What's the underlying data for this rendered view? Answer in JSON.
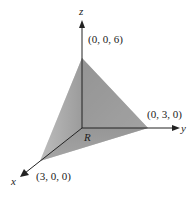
{
  "diagram": {
    "axes": {
      "x_label": "x",
      "y_label": "y",
      "z_label": "z"
    },
    "vertices": {
      "x_intercept": "(3, 0, 0)",
      "y_intercept": "(0, 3, 0)",
      "z_intercept": "(0, 0, 6)"
    },
    "region_label": "R",
    "colors": {
      "face_front": "#8c8c8c",
      "face_left": "#b5b5b5",
      "base_region": "#9a9a9a",
      "axis": "#222222"
    }
  }
}
